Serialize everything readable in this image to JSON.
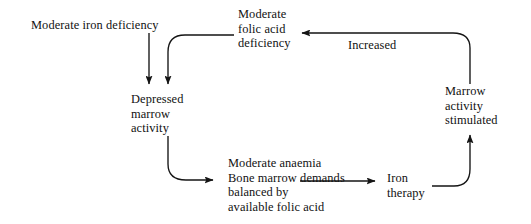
{
  "diagram": {
    "stroke_color": "#141414",
    "text_color": "#111111",
    "background_color": "#ffffff",
    "nodes": [
      {
        "id": "moderate-iron-deficiency",
        "lines": [
          "Moderate iron deficiency"
        ],
        "x": 31,
        "y": 18,
        "align": "left"
      },
      {
        "id": "moderate-folic-acid-deficiency",
        "lines": [
          "Moderate",
          "folic acid",
          "deficiency"
        ],
        "x": 238,
        "y": 7,
        "align": "left"
      },
      {
        "id": "depressed-marrow-activity",
        "lines": [
          "Depressed",
          "marrow",
          "activity"
        ],
        "x": 131,
        "y": 92,
        "align": "left"
      },
      {
        "id": "marrow-activity-stimulated",
        "lines": [
          "Marrow",
          "activity",
          "stimulated"
        ],
        "x": 445,
        "y": 84,
        "align": "left"
      },
      {
        "id": "moderate-anaemia-block",
        "lines": [
          "Moderate anaemia",
          "Bone marrow demands",
          "balanced by",
          "available folic acid"
        ],
        "x": 228,
        "y": 156,
        "align": "left"
      },
      {
        "id": "iron-therapy",
        "lines": [
          "Iron",
          "therapy"
        ],
        "x": 387,
        "y": 171,
        "align": "left"
      }
    ],
    "edge_labels": [
      {
        "id": "increased",
        "text": "Increased",
        "x": 348,
        "y": 38
      }
    ],
    "edges": [
      {
        "id": "iron-deficiency-to-depressed",
        "from": "moderate-iron-deficiency",
        "to": "depressed-marrow-activity",
        "arrow": true
      },
      {
        "id": "folic-acid-deficiency-to-depressed",
        "from": "moderate-folic-acid-deficiency",
        "to": "depressed-marrow-activity",
        "arrow": true
      },
      {
        "id": "depressed-to-moderate-anaemia",
        "from": "depressed-marrow-activity",
        "to": "moderate-anaemia-block",
        "arrow": true
      },
      {
        "id": "moderate-anaemia-to-iron-therapy",
        "from": "moderate-anaemia-block",
        "to": "iron-therapy",
        "arrow": true
      },
      {
        "id": "iron-therapy-to-marrow-stimulated",
        "from": "iron-therapy",
        "to": "marrow-activity-stimulated",
        "arrow": true
      },
      {
        "id": "marrow-stimulated-to-folic-acid-deficiency",
        "from": "marrow-activity-stimulated",
        "to": "moderate-folic-acid-deficiency",
        "arrow": true,
        "label": "Increased"
      }
    ]
  }
}
